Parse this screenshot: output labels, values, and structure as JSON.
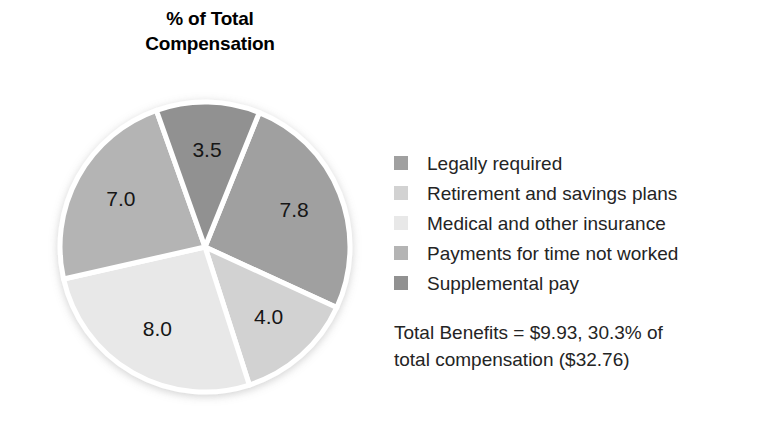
{
  "title": {
    "line1": "% of Total",
    "line2": "Compensation"
  },
  "legend": {
    "items": [
      {
        "label": "Legally required",
        "color": "#a0a0a0"
      },
      {
        "label": "Retirement and savings plans",
        "color": "#d2d2d2"
      },
      {
        "label": "Medical and other insurance",
        "color": "#e8e8e8"
      },
      {
        "label": "Payments for time not worked",
        "color": "#b4b4b4"
      },
      {
        "label": "Supplemental pay",
        "color": "#919191"
      }
    ]
  },
  "footnote": {
    "line1": "Total Benefits = $9.93, 30.3% of",
    "line2": "total compensation ($32.76)"
  },
  "chart_data": {
    "type": "pie",
    "title": "% of Total Compensation",
    "labels": [
      "Legally required",
      "Retirement and savings plans",
      "Medical and other insurance",
      "Payments for time not worked",
      "Supplemental pay"
    ],
    "values": [
      7.8,
      4.0,
      8.0,
      7.0,
      3.5
    ],
    "value_labels": [
      "7.8",
      "4.0",
      "8.0",
      "7.0",
      "3.5"
    ],
    "colors": [
      "#a0a0a0",
      "#d2d2d2",
      "#e8e8e8",
      "#b4b4b4",
      "#919191"
    ],
    "total": 30.3,
    "units": "percent of total compensation",
    "start_angle_deg": -68,
    "direction": "clockwise",
    "slice_separator_color": "#ffffff",
    "legend_position": "right",
    "annotations": [
      "Total Benefits = $9.93, 30.3% of total compensation ($32.76)"
    ]
  }
}
